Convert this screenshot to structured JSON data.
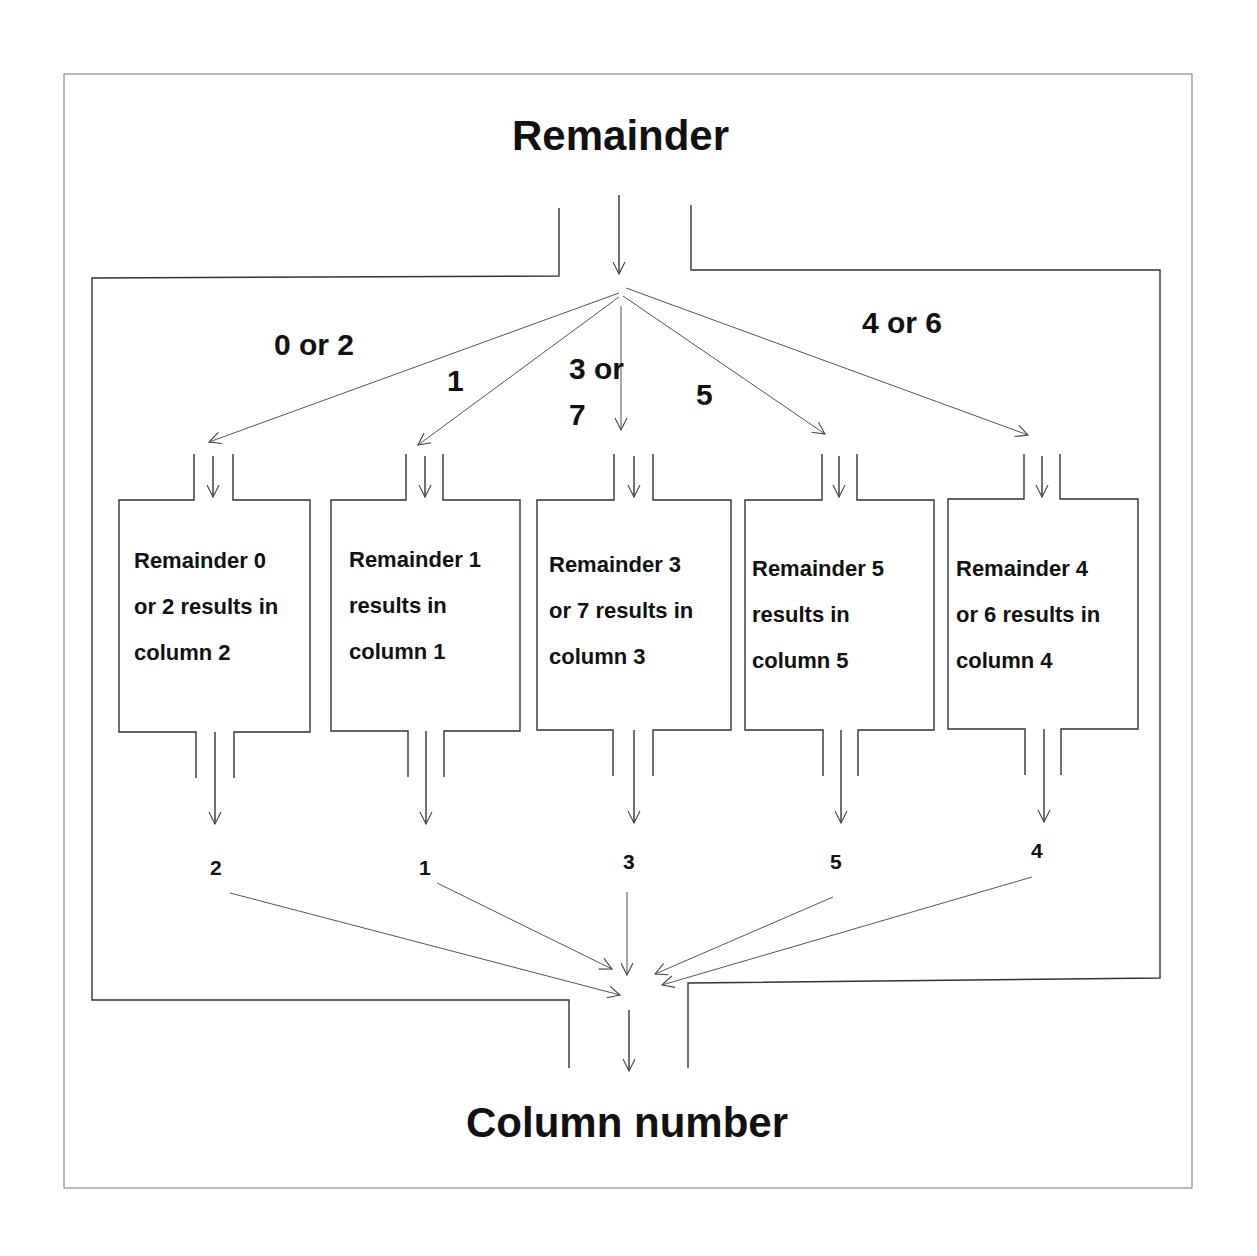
{
  "diagram": {
    "input_label": "Remainder",
    "output_label": "Column number",
    "branches": [
      {
        "label": "0 or 2"
      },
      {
        "label": "1"
      },
      {
        "label": "3 or\n7",
        "line1": "3 or",
        "line2": "7"
      },
      {
        "label": "5"
      },
      {
        "label": "4 or 6"
      }
    ],
    "boxes": [
      {
        "line1": "Remainder 0",
        "line2": "or 2 results in",
        "line3": "column 2"
      },
      {
        "line1": "Remainder 1",
        "line2": "results in",
        "line3": "column 1"
      },
      {
        "line1": "Remainder 3",
        "line2": "or 7 results in",
        "line3": "column 3"
      },
      {
        "line1": "Remainder 5",
        "line2": "results in",
        "line3": "column 5"
      },
      {
        "line1": "Remainder 4",
        "line2": "or 6 results in",
        "line3": "column 4"
      }
    ],
    "outputs": [
      "2",
      "1",
      "3",
      "5",
      "4"
    ]
  }
}
